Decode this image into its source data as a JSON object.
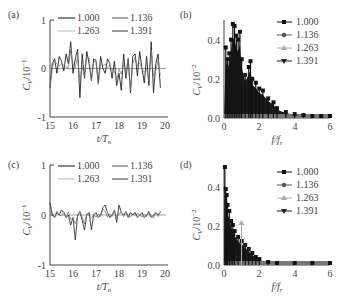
{
  "chart_data": [
    {
      "panel": "(a)",
      "type": "line",
      "title": "",
      "xlabel": "t/T_n",
      "ylabel": "C_V/10^-1",
      "xlim": [
        15,
        20
      ],
      "ylim": [
        -1,
        1
      ],
      "xticks": [
        "15",
        "16",
        "17",
        "18",
        "19",
        "20"
      ],
      "yticks": [
        "-1",
        "0",
        "1"
      ],
      "grid": false,
      "legend_position": "top, inside, 2 columns",
      "series": [
        {
          "name": "1.000",
          "color": "#111111"
        },
        {
          "name": "1.136",
          "color": "#555555"
        },
        {
          "name": "1.263",
          "color": "#aaaaaa"
        },
        {
          "name": "1.391",
          "color": "#333333"
        }
      ],
      "x": [
        15.0,
        15.1,
        15.2,
        15.3,
        15.4,
        15.5,
        15.6,
        15.7,
        15.8,
        15.9,
        16.0,
        16.1,
        16.2,
        16.3,
        16.4,
        16.5,
        16.6,
        16.7,
        16.8,
        16.9,
        17.0,
        17.1,
        17.2,
        17.3,
        17.4,
        17.5,
        17.6,
        17.7,
        17.8,
        17.9,
        18.0,
        18.1,
        18.2,
        18.3,
        18.4,
        18.5,
        18.6,
        18.7,
        18.8,
        18.9,
        19.0,
        19.1,
        19.2,
        19.3,
        19.4,
        19.5,
        19.6,
        19.7,
        19.8
      ],
      "values": [
        -0.4,
        0.1,
        0.2,
        -0.1,
        0.25,
        0.15,
        -0.05,
        0.3,
        0.1,
        0.55,
        -0.1,
        0.2,
        0.4,
        -0.6,
        0.3,
        -0.2,
        0.35,
        0.1,
        -0.25,
        0.2,
        0.15,
        -0.3,
        0.25,
        0.0,
        -0.1,
        0.2,
        0.1,
        -0.2,
        0.15,
        -0.35,
        -0.1,
        -0.45,
        0.3,
        -0.2,
        0.2,
        -0.5,
        0.25,
        0.3,
        -0.15,
        0.35,
        0.0,
        -0.3,
        0.25,
        -0.35,
        0.55,
        -0.5,
        0.1,
        0.3,
        -0.4
      ]
    },
    {
      "panel": "(b)",
      "type": "bar",
      "title": "",
      "xlabel": "f/f_r",
      "ylabel": "C_V/10^-2",
      "xlim": [
        0,
        6
      ],
      "ylim": [
        0.0,
        0.5
      ],
      "xticks": [
        "0",
        "2",
        "4",
        "6"
      ],
      "yticks": [
        "0.0",
        "0.2",
        "0.4"
      ],
      "grid": false,
      "legend_position": "upper right",
      "series": [
        {
          "name": "1.000",
          "marker": "square",
          "color": "#111111"
        },
        {
          "name": "1.136",
          "marker": "circle",
          "color": "#555555"
        },
        {
          "name": "1.263",
          "marker": "triangle-up",
          "color": "#aaaaaa"
        },
        {
          "name": "1.391",
          "marker": "triangle-down",
          "color": "#222222"
        }
      ],
      "x": [
        0.1,
        0.2,
        0.3,
        0.4,
        0.5,
        0.6,
        0.7,
        0.8,
        0.9,
        1.0,
        1.2,
        1.4,
        1.5,
        1.6,
        1.8,
        2.0,
        2.2,
        2.5,
        2.8,
        3.0,
        3.5,
        4.0,
        4.5,
        5.0,
        5.5,
        6.0
      ],
      "values": [
        0.36,
        0.3,
        0.33,
        0.4,
        0.48,
        0.47,
        0.42,
        0.4,
        0.44,
        0.3,
        0.22,
        0.26,
        0.29,
        0.2,
        0.18,
        0.15,
        0.14,
        0.1,
        0.08,
        0.05,
        0.03,
        0.02,
        0.015,
        0.01,
        0.01,
        0.01
      ]
    },
    {
      "panel": "(c)",
      "type": "line",
      "title": "",
      "xlabel": "t/T_n",
      "ylabel": "C_V/10^-1",
      "xlim": [
        15,
        20
      ],
      "ylim": [
        -1,
        1
      ],
      "xticks": [
        "15",
        "16",
        "17",
        "18",
        "19",
        "20"
      ],
      "yticks": [
        "-1",
        "0",
        "1"
      ],
      "grid": false,
      "legend_position": "top, inside, 2 columns",
      "series": [
        {
          "name": "1.000",
          "color": "#111111"
        },
        {
          "name": "1.136",
          "color": "#555555"
        },
        {
          "name": "1.263",
          "color": "#aaaaaa"
        },
        {
          "name": "1.391",
          "color": "#333333"
        }
      ],
      "x": [
        15.0,
        15.1,
        15.2,
        15.3,
        15.4,
        15.5,
        15.6,
        15.7,
        15.8,
        15.9,
        16.0,
        16.1,
        16.2,
        16.3,
        16.4,
        16.5,
        16.6,
        16.7,
        16.8,
        16.9,
        17.0,
        17.1,
        17.2,
        17.3,
        17.4,
        17.5,
        17.6,
        17.7,
        17.8,
        17.9,
        18.0,
        18.1,
        18.2,
        18.3,
        18.4,
        18.5,
        18.6,
        18.7,
        18.8,
        18.9,
        19.0,
        19.1,
        19.2,
        19.3,
        19.4,
        19.5,
        19.6,
        19.7,
        19.8
      ],
      "values": [
        0.25,
        0.0,
        -0.05,
        0.05,
        0.0,
        0.1,
        0.05,
        -0.05,
        0.0,
        -0.2,
        -0.05,
        -0.5,
        0.0,
        0.05,
        -0.1,
        -0.3,
        0.0,
        0.05,
        -0.3,
        0.0,
        0.05,
        -0.05,
        0.0,
        0.15,
        0.2,
        0.05,
        -0.05,
        0.0,
        0.1,
        -0.15,
        0.2,
        0.05,
        0.0,
        0.05,
        -0.05,
        0.05,
        0.0,
        0.05,
        -0.05,
        0.0,
        0.05,
        -0.05,
        0.0,
        0.05,
        -0.05,
        0.0,
        0.05,
        0.0,
        0.05
      ]
    },
    {
      "panel": "(d)",
      "type": "bar",
      "title": "",
      "xlabel": "f/f_r",
      "ylabel": "C_V/10^-2",
      "xlim": [
        0,
        6
      ],
      "ylim": [
        0.0,
        0.5
      ],
      "xticks": [
        "0",
        "2",
        "4",
        "6"
      ],
      "yticks": [
        "0.0",
        "0.2",
        "0.4"
      ],
      "grid": false,
      "legend_position": "upper right",
      "series": [
        {
          "name": "1.000",
          "marker": "square",
          "color": "#111111"
        },
        {
          "name": "1.136",
          "marker": "circle",
          "color": "#555555"
        },
        {
          "name": "1.263",
          "marker": "triangle-up",
          "color": "#aaaaaa"
        },
        {
          "name": "1.391",
          "marker": "triangle-down",
          "color": "#222222"
        }
      ],
      "x": [
        0.05,
        0.1,
        0.15,
        0.2,
        0.3,
        0.4,
        0.5,
        0.6,
        0.8,
        1.0,
        1.2,
        1.4,
        1.6,
        1.8,
        2.0,
        2.5,
        3.0,
        4.0,
        5.0,
        6.0
      ],
      "values": [
        0.49,
        0.38,
        0.35,
        0.3,
        0.27,
        0.22,
        0.2,
        0.17,
        0.14,
        0.12,
        0.1,
        0.08,
        0.06,
        0.04,
        0.03,
        0.015,
        0.01,
        0.01,
        0.01,
        0.01
      ],
      "annotations": [
        {
          "x": 1.0,
          "y": 0.21,
          "series": "1.263",
          "note": "isolated peak"
        }
      ]
    }
  ],
  "panels": {
    "a": {
      "label": "(a)"
    },
    "b": {
      "label": "(b)"
    },
    "c": {
      "label": "(c)"
    },
    "d": {
      "label": "(d)"
    }
  },
  "axis_text": {
    "time_xlabel": "t/T",
    "time_xlabel_sub": "n",
    "freq_xlabel": "f/f",
    "freq_xlabel_sub": "r",
    "ylabel_time": "C",
    "ylabel_time_sub": "V",
    "ylabel_time_scale": "/10",
    "ylabel_time_exp": "−1",
    "ylabel_freq_scale": "/10",
    "ylabel_freq_exp": "−2"
  },
  "legend": [
    "1.000",
    "1.136",
    "1.263",
    "1.391"
  ]
}
